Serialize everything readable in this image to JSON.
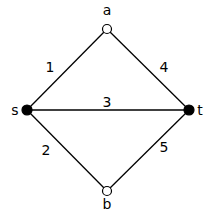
{
  "graph": {
    "nodes": [
      {
        "id": "a",
        "label": "a",
        "x": 107,
        "y": 29,
        "filled": false,
        "lx": 107,
        "ly": 15
      },
      {
        "id": "s",
        "label": "s",
        "x": 27,
        "y": 110,
        "filled": true,
        "lx": 15,
        "ly": 115
      },
      {
        "id": "t",
        "label": "t",
        "x": 189,
        "y": 110,
        "filled": true,
        "lx": 200,
        "ly": 115
      },
      {
        "id": "b",
        "label": "b",
        "x": 107,
        "y": 191,
        "filled": false,
        "lx": 107,
        "ly": 209
      }
    ],
    "edges": [
      {
        "from": "s",
        "to": "a",
        "label": "1",
        "lx": 50,
        "ly": 72
      },
      {
        "from": "s",
        "to": "b",
        "label": "2",
        "lx": 46,
        "ly": 155
      },
      {
        "from": "s",
        "to": "t",
        "label": "3",
        "lx": 107,
        "ly": 107
      },
      {
        "from": "a",
        "to": "t",
        "label": "4",
        "lx": 164,
        "ly": 72
      },
      {
        "from": "b",
        "to": "t",
        "label": "5",
        "lx": 164,
        "ly": 152
      }
    ]
  }
}
